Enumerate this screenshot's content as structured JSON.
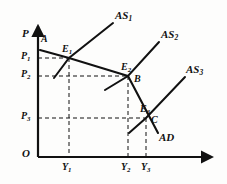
{
  "figure": {
    "type": "ad-as-diagram",
    "background_color": "#fdfdfc",
    "ink_color": "#111111"
  },
  "axes": {
    "origin_label": "O",
    "y_axis_label": "P",
    "x_axis_label": "",
    "origin_px": {
      "x": 38,
      "y": 157
    },
    "y_axis_top_px": {
      "x": 38,
      "y": 22
    },
    "x_axis_right_px": {
      "x": 216,
      "y": 157
    }
  },
  "price_ticks": [
    {
      "id": "p1",
      "label": "P",
      "sub": "1",
      "y_px": 58
    },
    {
      "id": "p2",
      "label": "P",
      "sub": "2",
      "y_px": 76
    },
    {
      "id": "p3",
      "label": "P",
      "sub": "3",
      "y_px": 118
    }
  ],
  "output_ticks": [
    {
      "id": "y1",
      "label": "Y",
      "sub": "1",
      "x_px": 69
    },
    {
      "id": "y2",
      "label": "Y",
      "sub": "2",
      "x_px": 128
    },
    {
      "id": "y3",
      "label": "Y",
      "sub": "3",
      "x_px": 146
    }
  ],
  "equilibria": [
    {
      "id": "e1",
      "label": "E",
      "sub": "1",
      "x_px": 69,
      "y_px": 58
    },
    {
      "id": "e2",
      "label": "E",
      "sub": "2",
      "x_px": 128,
      "y_px": 76
    },
    {
      "id": "e3",
      "label": "E",
      "sub": "3",
      "x_px": 146,
      "y_px": 118
    }
  ],
  "point_labels": [
    {
      "id": "a",
      "label": "A",
      "x_px": 44,
      "y_px": 40
    },
    {
      "id": "b",
      "label": "B",
      "x_px": 136,
      "y_px": 80
    },
    {
      "id": "c",
      "label": "C",
      "x_px": 153,
      "y_px": 121
    }
  ],
  "curves": {
    "ad": {
      "name": "AD",
      "label": "AD",
      "sub": "",
      "label_x_px": 160,
      "label_y_px": 137,
      "description": "Aggregate demand, downward sloping, kinked through A-E1-E2-C"
    },
    "as": [
      {
        "name": "AS1",
        "label": "AS",
        "sub": "1",
        "label_x_px": 118,
        "label_y_px": 17,
        "description": "Short-run aggregate supply curve 1, through E1"
      },
      {
        "name": "AS2",
        "label": "AS",
        "sub": "2",
        "label_x_px": 163,
        "label_y_px": 35,
        "description": "Short-run aggregate supply curve 2, through E2"
      },
      {
        "name": "AS3",
        "label": "AS",
        "sub": "3",
        "label_x_px": 188,
        "label_y_px": 70,
        "description": "Short-run aggregate supply curve 3, through E3"
      }
    ]
  },
  "geometry": {
    "ad_path": "M 40,50 L 69,58 L 128,76 L 158,133",
    "as1_path": "M 54,76 L 69,58 L 114,22",
    "as2_path": "M 106,89 L 128,76 L 160,41",
    "as3_path": "M 129,133 L 146,118 L 186,76",
    "dashed_p1": "M 38,58 L 69,58",
    "dashed_p2": "M 38,76 L 128,76",
    "dashed_p3": "M 38,118 L 146,118",
    "dashed_y1": "M 69,58 L 69,157",
    "dashed_y2": "M 128,76 L 128,157",
    "dashed_y3": "M 146,118 L 146,157"
  }
}
